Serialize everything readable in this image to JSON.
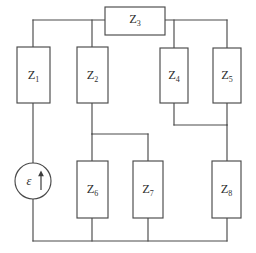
{
  "figure": {
    "type": "electrical-circuit-schematic",
    "title": "",
    "background_color": "#ffffff",
    "line_color": "#4a4a4a",
    "text_color": "#2e2e2e",
    "width": 256,
    "height": 253
  },
  "source": {
    "symbol": "emf-source",
    "label_base": "ε",
    "label_full": "ε",
    "arrow_direction": "up",
    "shape": "circle",
    "center_x": 33,
    "center_y": 181,
    "radius": 18
  },
  "impedances": [
    {
      "id": "z1",
      "label_base": "Z",
      "label_sub": "1",
      "label_full": "Z₁",
      "x": 17,
      "y": 47,
      "w": 33,
      "h": 56,
      "orientation": "vertical"
    },
    {
      "id": "z2",
      "label_base": "Z",
      "label_sub": "2",
      "label_full": "Z₂",
      "x": 77,
      "y": 47,
      "w": 31,
      "h": 56,
      "orientation": "vertical"
    },
    {
      "id": "z3",
      "label_base": "Z",
      "label_sub": "3",
      "label_full": "Z₃",
      "x": 105,
      "y": 7,
      "w": 60,
      "h": 28,
      "orientation": "horizontal"
    },
    {
      "id": "z4",
      "label_base": "Z",
      "label_sub": "4",
      "label_full": "Z₄",
      "x": 160,
      "y": 48,
      "w": 28,
      "h": 55,
      "orientation": "vertical"
    },
    {
      "id": "z5",
      "label_base": "Z",
      "label_sub": "5",
      "label_full": "Z₅",
      "x": 213,
      "y": 48,
      "w": 28,
      "h": 55,
      "orientation": "vertical"
    },
    {
      "id": "z6",
      "label_base": "Z",
      "label_sub": "6",
      "label_full": "Z₆",
      "x": 77,
      "y": 161,
      "w": 31,
      "h": 57,
      "orientation": "vertical"
    },
    {
      "id": "z7",
      "label_base": "Z",
      "label_sub": "7",
      "label_full": "Z₇",
      "x": 133,
      "y": 161,
      "w": 30,
      "h": 57,
      "orientation": "vertical"
    },
    {
      "id": "z8",
      "label_base": "Z",
      "label_sub": "8",
      "label_full": "Z₈",
      "x": 212,
      "y": 161,
      "w": 29,
      "h": 57,
      "orientation": "vertical"
    }
  ],
  "nodes": {
    "top_rail_y": 20,
    "bottom_rail_y": 241,
    "left_rail_x": 33,
    "right_rail_x": 227,
    "mid_left_y": 134,
    "mid_right_y": 125
  },
  "wires": [
    {
      "name": "top-left-rail",
      "path": "M 33 20 L 105 20"
    },
    {
      "name": "z1-top-stub",
      "path": "M 33 20 L 33 47"
    },
    {
      "name": "z2-top-stub",
      "path": "M 92 20 L 92 47"
    },
    {
      "name": "top-right-rail",
      "path": "M 165 20 L 227 20"
    },
    {
      "name": "z4-top-stub",
      "path": "M 174 20 L 174 48"
    },
    {
      "name": "z5-top-stub",
      "path": "M 227 20 L 227 48"
    },
    {
      "name": "z1-bottom-to-source",
      "path": "M 33 103 L 33 163"
    },
    {
      "name": "source-to-bottom-rail",
      "path": "M 33 199 L 33 241"
    },
    {
      "name": "z2-bottom-stub",
      "path": "M 92 103 L 92 134"
    },
    {
      "name": "mid-left-connector",
      "path": "M 92 134 L 148 134"
    },
    {
      "name": "z6-top-stub",
      "path": "M 92 134 L 92 161"
    },
    {
      "name": "z7-top-stub",
      "path": "M 148 134 L 148 161"
    },
    {
      "name": "z4-bottom-stub",
      "path": "M 174 103 L 174 125"
    },
    {
      "name": "mid-right-connector",
      "path": "M 174 125 L 227 125"
    },
    {
      "name": "z5-bottom-stub",
      "path": "M 227 103 L 227 125"
    },
    {
      "name": "z8-top-stub",
      "path": "M 227 125 L 227 161"
    },
    {
      "name": "z6-bottom-stub",
      "path": "M 92 218 L 92 241"
    },
    {
      "name": "z7-bottom-stub",
      "path": "M 148 218 L 148 241"
    },
    {
      "name": "z8-bottom-stub",
      "path": "M 227 218 L 227 241"
    },
    {
      "name": "bottom-rail",
      "path": "M 33 241 L 227 241"
    }
  ]
}
